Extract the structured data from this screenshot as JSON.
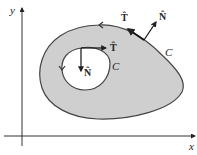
{
  "figure": {
    "axes": {
      "x_label": "x",
      "y_label": "y"
    },
    "region": {
      "fill_color": "#cfcfcf",
      "stroke_color": "#444444"
    },
    "outer_curve": {
      "label": "C",
      "tangent_label": "T̂",
      "normal_label": "N̂"
    },
    "inner_curve": {
      "label": "C",
      "tangent_label": "T̂",
      "normal_label": "N̂"
    }
  }
}
